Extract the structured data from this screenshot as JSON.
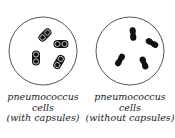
{
  "panels": [
    {
      "id": "with-capsules",
      "caption": {
        "line1": "pneumococcus",
        "line2": "cells",
        "line3": "(with capsules)"
      },
      "dish": {
        "cx": 43,
        "cy": 51,
        "r": 34
      },
      "cells": [
        {
          "x": 45,
          "y": 35,
          "angle": -45
        },
        {
          "x": 61,
          "y": 44,
          "angle": 0
        },
        {
          "x": 36,
          "y": 58,
          "angle": 90
        },
        {
          "x": 59,
          "y": 62,
          "angle": -60
        }
      ]
    },
    {
      "id": "without-capsules",
      "caption": {
        "line1": "pneumococcus",
        "line2": "cells",
        "line3": "(without capsules)"
      },
      "dish": {
        "cx": 130,
        "cy": 51,
        "r": 34
      },
      "cells": [
        {
          "x": 133,
          "y": 34,
          "angle": 85
        },
        {
          "x": 152,
          "y": 43,
          "angle": 30
        },
        {
          "x": 120,
          "y": 60,
          "angle": -60
        },
        {
          "x": 144,
          "y": 63,
          "angle": 68
        }
      ]
    }
  ],
  "colors": {
    "dish_outline": "#555555",
    "cell_fill": "#111111",
    "capsule_line": "#ffffff",
    "text": "#1a1a1a"
  }
}
